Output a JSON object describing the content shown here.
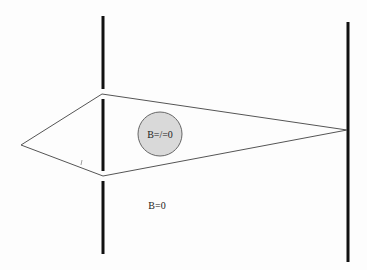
{
  "diagram": {
    "type": "aharonov-bohm-two-slit",
    "labels": {
      "inside_region": "B=/=0",
      "outside_region": "B=0"
    },
    "colors": {
      "barrier": "#111111",
      "path": "#555555",
      "flux_fill": "#d9d9d9",
      "flux_stroke": "#666666",
      "background": "#fdfdfd"
    },
    "source": {
      "x": 21,
      "y": 145
    },
    "slit_barrier": {
      "x": 103,
      "top": 16,
      "bottom": 254,
      "slits": [
        {
          "y1": 89,
          "y2": 99
        },
        {
          "y1": 171,
          "y2": 181
        }
      ]
    },
    "screen": {
      "x": 348,
      "top": 22,
      "bottom": 262
    },
    "detection_point": {
      "x": 347,
      "y": 130
    },
    "paths": [
      {
        "name": "upper-path",
        "points": [
          [
            21,
            145
          ],
          [
            102,
            94
          ],
          [
            347,
            130
          ]
        ]
      },
      {
        "name": "lower-path",
        "points": [
          [
            21,
            145
          ],
          [
            103,
            176
          ],
          [
            347,
            130
          ]
        ]
      }
    ],
    "flux_region": {
      "cx": 160,
      "cy": 134,
      "r": 22
    }
  }
}
